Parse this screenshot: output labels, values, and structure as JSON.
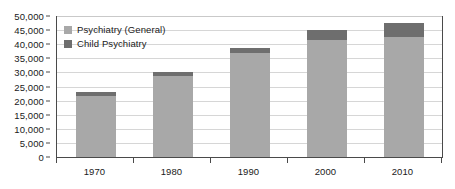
{
  "chart_data": {
    "type": "bar",
    "title": "",
    "subtitle": "",
    "xlabel": "",
    "ylabel": "",
    "stacked": true,
    "grid": true,
    "legend_position": "top-left-inside",
    "categories": [
      "1970",
      "1980",
      "1990",
      "2000",
      "2010"
    ],
    "ylim": [
      0,
      50000
    ],
    "ytick_step": 5000,
    "ytick_labels": [
      "50,000",
      "45,000",
      "40,000",
      "35,000",
      "30,000",
      "25,000",
      "20,000",
      "15,000",
      "10,000",
      "5,000",
      "0"
    ],
    "ytick_values": [
      50000,
      45000,
      40000,
      35000,
      30000,
      25000,
      20000,
      15000,
      10000,
      5000,
      0
    ],
    "series": [
      {
        "name": "Psychiatry (General)",
        "color": "#a8a8a8",
        "values": [
          21700,
          28700,
          36800,
          41400,
          42700
        ]
      },
      {
        "name": "Child Psychiatry",
        "color": "#6e6e6e",
        "values": [
          1500,
          1600,
          1900,
          3600,
          4700
        ]
      }
    ],
    "totals": [
      23200,
      30300,
      38700,
      45000,
      47400
    ]
  },
  "legend": {
    "items": [
      {
        "label": "Psychiatry (General)",
        "color": "#a8a8a8"
      },
      {
        "label": "Child Psychiatry",
        "color": "#6e6e6e"
      }
    ]
  },
  "colors": {
    "general": "#a8a8a8",
    "child": "#6e6e6e",
    "axis": "#4a4a4a",
    "grid": "#d6d6d6",
    "text": "#1a1a1a",
    "background": "#ffffff"
  }
}
